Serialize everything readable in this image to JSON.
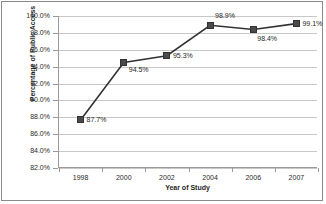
{
  "chart_data": {
    "type": "line",
    "title": "",
    "xlabel": "Year of Study",
    "ylabel": "Percentage of Public Access",
    "categories": [
      "1998",
      "2000",
      "2002",
      "2004",
      "2006",
      "2007"
    ],
    "values": [
      87.7,
      94.5,
      95.3,
      98.9,
      98.4,
      99.1
    ],
    "point_labels": [
      "87.7%",
      "94.5%",
      "95.3%",
      "98.9%",
      "98.4%",
      "99.1%"
    ],
    "ylim": [
      82.0,
      100.0
    ],
    "ytick_labels": [
      "100.0%",
      "98.0%",
      "96.0%",
      "94.0%",
      "92.0%",
      "90.0%",
      "88.0%",
      "86.0%",
      "84.0%",
      "82.0%"
    ],
    "ytick_values": [
      100.0,
      98.0,
      96.0,
      94.0,
      92.0,
      90.0,
      88.0,
      86.0,
      84.0,
      82.0
    ],
    "grid": true,
    "legend": "none",
    "series_color": "#4a4a4a",
    "line_color": "#333333",
    "gridline_color": "#c8c8c8",
    "axis_color": "#9a9a9a",
    "background_color": "#ffffff",
    "label_offsets": [
      {
        "dx": 6,
        "dy": -4
      },
      {
        "dx": 5,
        "dy": 4
      },
      {
        "dx": 6,
        "dy": -4
      },
      {
        "dx": 5,
        "dy": -13
      },
      {
        "dx": 4,
        "dy": 5
      },
      {
        "dx": 6,
        "dy": -4
      }
    ]
  }
}
